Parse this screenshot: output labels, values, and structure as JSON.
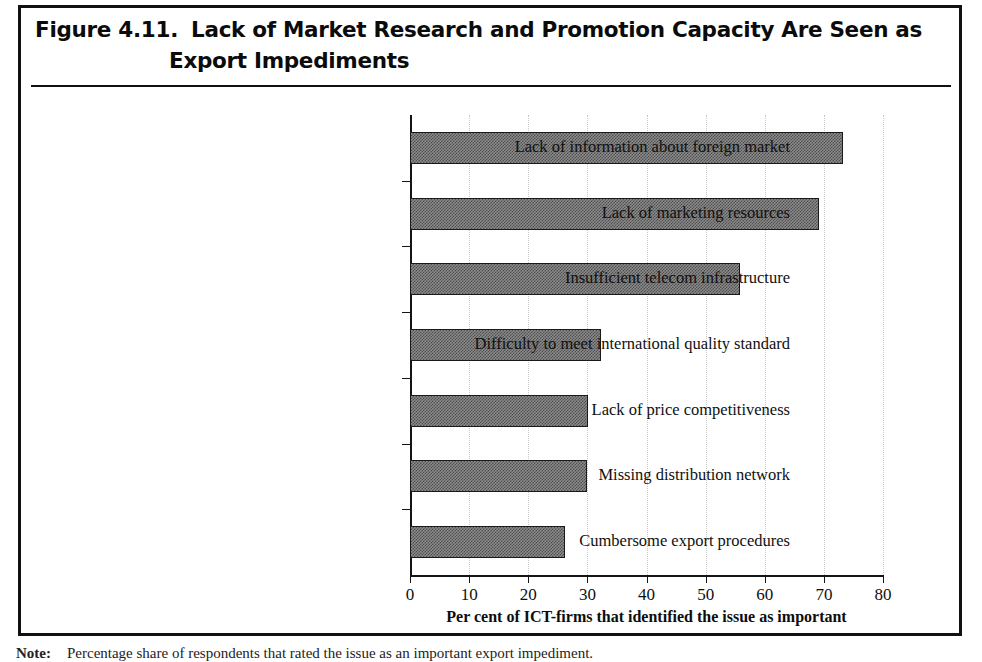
{
  "figure": {
    "number": "Figure 4.11.",
    "title_line1": "Lack of Market Research and Promotion Capacity Are Seen as",
    "title_line2": "Export Impediments"
  },
  "footnote": {
    "label": "Note:",
    "text": "Percentage share of respondents that rated the issue as an important export impediment."
  },
  "chart_data": {
    "type": "bar",
    "orientation": "horizontal",
    "title": "Lack of Market Research and Promotion Capacity Are Seen as Export Impediments",
    "xlabel": "Per cent of ICT-firms that identified the issue as important",
    "ylabel": "",
    "xlim": [
      0,
      80
    ],
    "xticks": [
      0,
      10,
      20,
      30,
      40,
      50,
      60,
      70,
      80
    ],
    "xtick_labels": [
      "0",
      "10",
      "20",
      "30",
      "40",
      "50",
      "60",
      "70",
      "80"
    ],
    "grid": "vertical-dotted",
    "legend": "none",
    "categories": [
      "Lack of information about foreign market",
      "Lack of marketing resources",
      "Insufficient telecom infrastructure",
      "Difficulty to meet international quality standard",
      "Lack of price competitiveness",
      "Missing distribution network",
      "Cumbersome export procedures"
    ],
    "values": [
      73.3,
      69.2,
      55.8,
      32.3,
      30.1,
      29.9,
      26.2
    ],
    "bar_color": "#8a8a8a",
    "bar_edge_color": "#1a1a1a"
  },
  "colors": {
    "frame": "#111111",
    "axis": "#151515",
    "grid": "#c9c9c9",
    "text": "#101010"
  }
}
